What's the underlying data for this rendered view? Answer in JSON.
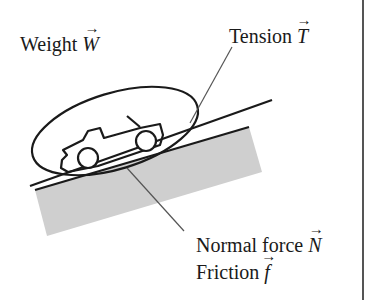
{
  "diagram": {
    "labels": {
      "weight": {
        "text": "Weight",
        "symbol": "W"
      },
      "tension": {
        "text": "Tension",
        "symbol": "T"
      },
      "normal": {
        "text": "Normal force",
        "symbol": "N"
      },
      "friction": {
        "text": "Friction",
        "symbol": "f"
      }
    },
    "colors": {
      "ink": "#1a1a1a",
      "ground_fill": "#cfcfcf",
      "leader_line": "#555555",
      "border": "#555555"
    }
  }
}
